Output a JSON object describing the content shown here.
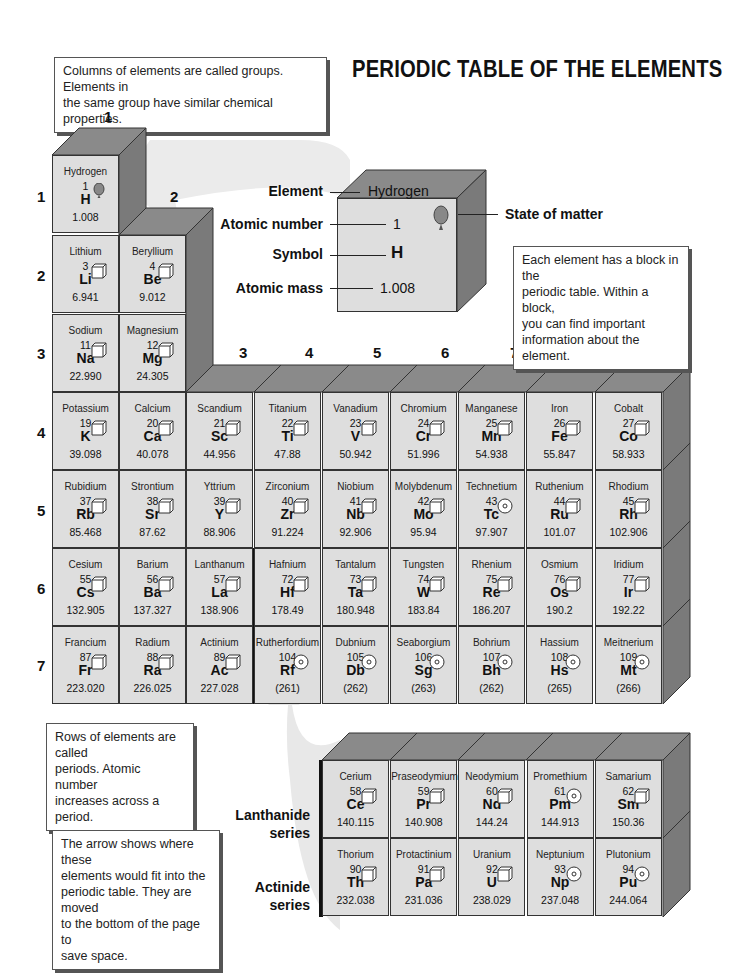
{
  "title": "PERIODIC TABLE OF THE ELEMENTS",
  "callouts": {
    "groups": [
      "Columns of elements are called groups. Elements in",
      "the same group have similar chemical properties."
    ],
    "block": [
      "Each element has a block in the",
      "periodic table. Within a block,",
      "you can find important",
      "information about the element."
    ],
    "periods": [
      "Rows of elements are called",
      "periods. Atomic number",
      "increases across a period."
    ],
    "arrow": [
      "The arrow shows where these",
      "elements would fit into the",
      "periodic table. They are moved",
      "to the bottom of the page to",
      "save space."
    ]
  },
  "key": {
    "element_label": "Element",
    "element_value": "Hydrogen",
    "atomic_number_label": "Atomic number",
    "atomic_number_value": "1",
    "symbol_label": "Symbol",
    "symbol_value": "H",
    "atomic_mass_label": "Atomic mass",
    "atomic_mass_value": "1.008",
    "state_label": "State of matter"
  },
  "groups": [
    "1",
    "2",
    "3",
    "4",
    "5",
    "6",
    "7",
    "8",
    "9"
  ],
  "periods": [
    "1",
    "2",
    "3",
    "4",
    "5",
    "6",
    "7"
  ],
  "series_labels": {
    "lanthanide": [
      "Lanthanide",
      "series"
    ],
    "actinide": [
      "Actinide",
      "series"
    ]
  },
  "elements": [
    {
      "name": "Hydrogen",
      "num": "1",
      "sym": "H",
      "mass": "1.008",
      "state": "gas"
    },
    {
      "name": "Lithium",
      "num": "3",
      "sym": "Li",
      "mass": "6.941",
      "state": "solid"
    },
    {
      "name": "Beryllium",
      "num": "4",
      "sym": "Be",
      "mass": "9.012",
      "state": "solid"
    },
    {
      "name": "Sodium",
      "num": "11",
      "sym": "Na",
      "mass": "22.990",
      "state": "solid"
    },
    {
      "name": "Magnesium",
      "num": "12",
      "sym": "Mg",
      "mass": "24.305",
      "state": "solid"
    },
    {
      "name": "Potassium",
      "num": "19",
      "sym": "K",
      "mass": "39.098",
      "state": "solid"
    },
    {
      "name": "Calcium",
      "num": "20",
      "sym": "Ca",
      "mass": "40.078",
      "state": "solid"
    },
    {
      "name": "Scandium",
      "num": "21",
      "sym": "Sc",
      "mass": "44.956",
      "state": "solid"
    },
    {
      "name": "Titanium",
      "num": "22",
      "sym": "Ti",
      "mass": "47.88",
      "state": "solid"
    },
    {
      "name": "Vanadium",
      "num": "23",
      "sym": "V",
      "mass": "50.942",
      "state": "solid"
    },
    {
      "name": "Chromium",
      "num": "24",
      "sym": "Cr",
      "mass": "51.996",
      "state": "solid"
    },
    {
      "name": "Manganese",
      "num": "25",
      "sym": "Mn",
      "mass": "54.938",
      "state": "solid"
    },
    {
      "name": "Iron",
      "num": "26",
      "sym": "Fe",
      "mass": "55.847",
      "state": "solid"
    },
    {
      "name": "Cobalt",
      "num": "27",
      "sym": "Co",
      "mass": "58.933",
      "state": "solid"
    },
    {
      "name": "Rubidium",
      "num": "37",
      "sym": "Rb",
      "mass": "85.468",
      "state": "solid"
    },
    {
      "name": "Strontium",
      "num": "38",
      "sym": "Sr",
      "mass": "87.62",
      "state": "solid"
    },
    {
      "name": "Yttrium",
      "num": "39",
      "sym": "Y",
      "mass": "88.906",
      "state": "solid"
    },
    {
      "name": "Zirconium",
      "num": "40",
      "sym": "Zr",
      "mass": "91.224",
      "state": "solid"
    },
    {
      "name": "Niobium",
      "num": "41",
      "sym": "Nb",
      "mass": "92.906",
      "state": "solid"
    },
    {
      "name": "Molybdenum",
      "num": "42",
      "sym": "Mo",
      "mass": "95.94",
      "state": "solid"
    },
    {
      "name": "Technetium",
      "num": "43",
      "sym": "Tc",
      "mass": "97.907",
      "state": "synthetic"
    },
    {
      "name": "Ruthenium",
      "num": "44",
      "sym": "Ru",
      "mass": "101.07",
      "state": "solid"
    },
    {
      "name": "Rhodium",
      "num": "45",
      "sym": "Rh",
      "mass": "102.906",
      "state": "solid"
    },
    {
      "name": "Cesium",
      "num": "55",
      "sym": "Cs",
      "mass": "132.905",
      "state": "solid"
    },
    {
      "name": "Barium",
      "num": "56",
      "sym": "Ba",
      "mass": "137.327",
      "state": "solid"
    },
    {
      "name": "Lanthanum",
      "num": "57",
      "sym": "La",
      "mass": "138.906",
      "state": "solid"
    },
    {
      "name": "Hafnium",
      "num": "72",
      "sym": "Hf",
      "mass": "178.49",
      "state": "solid"
    },
    {
      "name": "Tantalum",
      "num": "73",
      "sym": "Ta",
      "mass": "180.948",
      "state": "solid"
    },
    {
      "name": "Tungsten",
      "num": "74",
      "sym": "W",
      "mass": "183.84",
      "state": "solid"
    },
    {
      "name": "Rhenium",
      "num": "75",
      "sym": "Re",
      "mass": "186.207",
      "state": "solid"
    },
    {
      "name": "Osmium",
      "num": "76",
      "sym": "Os",
      "mass": "190.2",
      "state": "solid"
    },
    {
      "name": "Iridium",
      "num": "77",
      "sym": "Ir",
      "mass": "192.22",
      "state": "solid"
    },
    {
      "name": "Francium",
      "num": "87",
      "sym": "Fr",
      "mass": "223.020",
      "state": "solid"
    },
    {
      "name": "Radium",
      "num": "88",
      "sym": "Ra",
      "mass": "226.025",
      "state": "solid"
    },
    {
      "name": "Actinium",
      "num": "89",
      "sym": "Ac",
      "mass": "227.028",
      "state": "solid"
    },
    {
      "name": "Rutherfordium",
      "num": "104",
      "sym": "Rf",
      "mass": "(261)",
      "state": "synthetic"
    },
    {
      "name": "Dubnium",
      "num": "105",
      "sym": "Db",
      "mass": "(262)",
      "state": "synthetic"
    },
    {
      "name": "Seaborgium",
      "num": "106",
      "sym": "Sg",
      "mass": "(263)",
      "state": "synthetic"
    },
    {
      "name": "Bohrium",
      "num": "107",
      "sym": "Bh",
      "mass": "(262)",
      "state": "synthetic"
    },
    {
      "name": "Hassium",
      "num": "108",
      "sym": "Hs",
      "mass": "(265)",
      "state": "synthetic"
    },
    {
      "name": "Meitnerium",
      "num": "109",
      "sym": "Mt",
      "mass": "(266)",
      "state": "synthetic"
    },
    {
      "name": "Cerium",
      "num": "58",
      "sym": "Ce",
      "mass": "140.115",
      "state": "solid"
    },
    {
      "name": "Praseodymium",
      "num": "59",
      "sym": "Pr",
      "mass": "140.908",
      "state": "solid"
    },
    {
      "name": "Neodymium",
      "num": "60",
      "sym": "Nd",
      "mass": "144.24",
      "state": "solid"
    },
    {
      "name": "Promethium",
      "num": "61",
      "sym": "Pm",
      "mass": "144.913",
      "state": "synthetic"
    },
    {
      "name": "Samarium",
      "num": "62",
      "sym": "Sm",
      "mass": "150.36",
      "state": "solid"
    },
    {
      "name": "Thorium",
      "num": "90",
      "sym": "Th",
      "mass": "232.038",
      "state": "solid"
    },
    {
      "name": "Protactinium",
      "num": "91",
      "sym": "Pa",
      "mass": "231.036",
      "state": "solid"
    },
    {
      "name": "Uranium",
      "num": "92",
      "sym": "U",
      "mass": "238.029",
      "state": "solid"
    },
    {
      "name": "Neptunium",
      "num": "93",
      "sym": "Np",
      "mass": "237.048",
      "state": "synthetic"
    },
    {
      "name": "Plutonium",
      "num": "94",
      "sym": "Pu",
      "mass": "244.064",
      "state": "synthetic"
    }
  ],
  "colors": {
    "cell": "#dedede",
    "top_face": "#8a8a8a",
    "side_face": "#7a7a7a",
    "arrow": "#e6e6e6"
  }
}
